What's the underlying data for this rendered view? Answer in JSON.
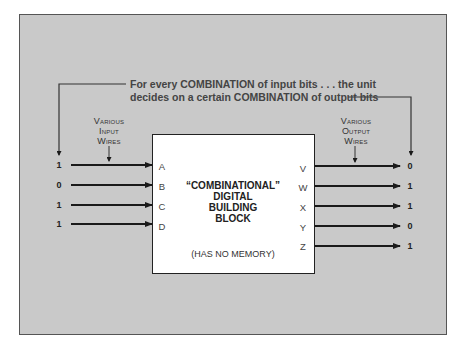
{
  "caption": {
    "line1": "For every COMBINATION of input bits . . . the unit",
    "line2": "decides on a certain COMBINATION of output bits"
  },
  "input_label": {
    "lines": [
      "Various",
      "Input",
      "Wires"
    ]
  },
  "output_label": {
    "lines": [
      "Various",
      "Output",
      "Wires"
    ]
  },
  "block": {
    "title_lines": [
      "“COMBINATIONAL”",
      "DIGITAL",
      "BUILDING",
      "BLOCK"
    ],
    "note": "(HAS NO MEMORY)"
  },
  "inputs": [
    {
      "pin": "A",
      "value": "1"
    },
    {
      "pin": "B",
      "value": "0"
    },
    {
      "pin": "C",
      "value": "1"
    },
    {
      "pin": "D",
      "value": "1"
    }
  ],
  "outputs": [
    {
      "pin": "V",
      "value": "0"
    },
    {
      "pin": "W",
      "value": "1"
    },
    {
      "pin": "X",
      "value": "1"
    },
    {
      "pin": "Y",
      "value": "0"
    },
    {
      "pin": "Z",
      "value": "1"
    }
  ],
  "colors": {
    "background": "#c9c9c9",
    "block": "#ffffff",
    "wire": "#1a1a1a"
  }
}
